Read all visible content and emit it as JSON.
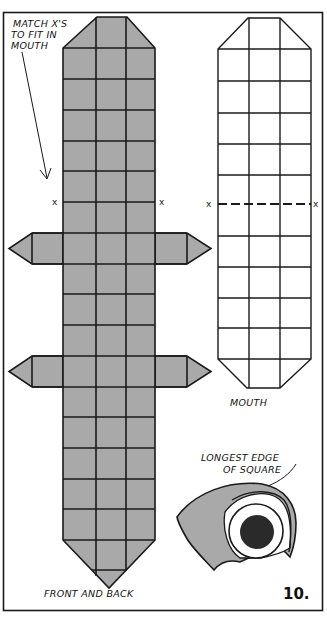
{
  "figure": {
    "number": "10.",
    "colors": {
      "fill": "#a9a9a9",
      "ink": "#1a1a1a",
      "paper": "#ffffff",
      "pupil": "#2a2a2a"
    }
  },
  "labels": {
    "match_line1": "MATCH X'S",
    "match_line2": "TO FIT IN",
    "match_line3": "MOUTH",
    "front_back": "FRONT AND BACK",
    "mouth": "MOUTH",
    "longest_line1": "LONGEST EDGE",
    "longest_line2": "OF SQUARE"
  },
  "marks": {
    "x": "x"
  },
  "front_back_pattern": {
    "columns": 3,
    "rows": 16,
    "tab_rows": [
      6,
      10
    ]
  },
  "mouth_pattern": {
    "columns": 3,
    "rows": 10,
    "dashed_row_line": 5
  }
}
